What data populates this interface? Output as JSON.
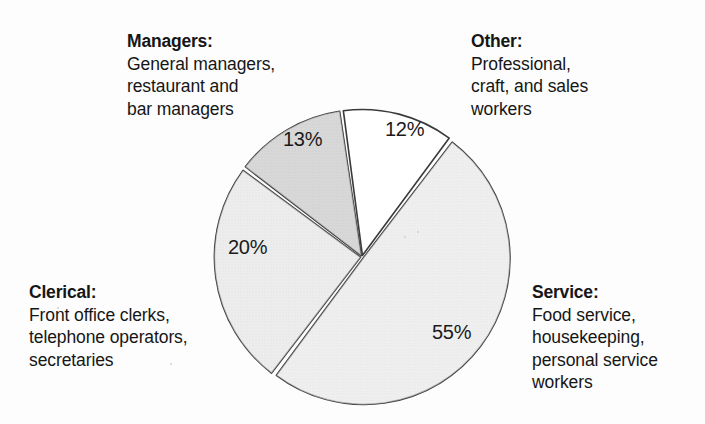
{
  "chart_data": {
    "type": "pie",
    "title": "",
    "categories": [
      "Other",
      "Service",
      "Clerical",
      "Managers"
    ],
    "values": [
      12,
      55,
      20,
      13
    ],
    "value_labels": [
      "12%",
      "55%",
      "20%",
      "13%"
    ],
    "units": "percent",
    "legend_position": "callouts-around-chart",
    "grid": false,
    "slices": [
      {
        "category": "Other",
        "value": 12,
        "label": "12%",
        "color": "#ffffff",
        "start_angle_deg": 352,
        "end_angle_deg": 37
      },
      {
        "category": "Service",
        "value": 55,
        "label": "55%",
        "color": "#dcdcdc",
        "start_angle_deg": 37,
        "end_angle_deg": 217
      },
      {
        "category": "Clerical",
        "value": 20,
        "label": "20%",
        "color": "#d7d7d7",
        "start_angle_deg": 217,
        "end_angle_deg": 307
      },
      {
        "category": "Managers",
        "value": 13,
        "label": "13%",
        "color": "#a9a9a9",
        "start_angle_deg": 307,
        "end_angle_deg": 352
      }
    ]
  },
  "callouts": {
    "managers": {
      "caption": "Managers:",
      "line1": "General managers,",
      "line2": "restaurant and",
      "line3": "bar managers"
    },
    "other": {
      "caption": "Other:",
      "line1": "Professional,",
      "line2": "craft, and sales",
      "line3": "workers"
    },
    "clerical": {
      "caption": "Clerical:",
      "line1": "Front office clerks,",
      "line2": "telephone operators,",
      "line3": "secretaries"
    },
    "service": {
      "caption": "Service:",
      "line1": "Food service,",
      "line2": "housekeeping,",
      "line3": "personal service",
      "line4": "workers"
    }
  },
  "colors": {
    "slice_white": "#ffffff",
    "slice_light_gray": "#dcdcdc",
    "slice_medium_gray": "#d7d7d7",
    "slice_dark_gray": "#a9a9a9",
    "outline": "#3a3a3a",
    "text": "#161616",
    "background": "#fdfdfd"
  }
}
